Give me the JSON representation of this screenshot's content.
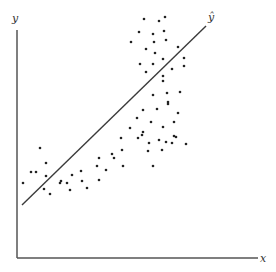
{
  "chart_data": {
    "type": "scatter",
    "title": "",
    "xlabel": "x",
    "ylabel": "y",
    "fit_label": "ŷ",
    "grid": false,
    "legend": null,
    "note": "Schematic scatter with linear regression line ŷ; no tick labels. Points listed in pixel coordinates (x right, y down).",
    "axes": {
      "origin": [
        17,
        258
      ],
      "x_end": [
        258,
        258
      ],
      "y_end": [
        17,
        30
      ]
    },
    "fit_line": {
      "start": [
        22,
        205
      ],
      "end": [
        206,
        26
      ]
    },
    "points": [
      [
        144,
        19
      ],
      [
        159,
        21
      ],
      [
        165,
        17
      ],
      [
        139,
        32
      ],
      [
        153,
        34
      ],
      [
        164,
        31
      ],
      [
        131,
        42
      ],
      [
        154,
        42
      ],
      [
        166,
        40
      ],
      [
        178,
        47
      ],
      [
        155,
        53
      ],
      [
        146,
        49
      ],
      [
        140,
        64
      ],
      [
        153,
        64
      ],
      [
        163,
        59
      ],
      [
        184,
        58
      ],
      [
        184,
        66
      ],
      [
        146,
        72
      ],
      [
        172,
        69
      ],
      [
        163,
        76
      ],
      [
        163,
        81
      ],
      [
        167,
        93
      ],
      [
        180,
        92
      ],
      [
        153,
        95
      ],
      [
        168,
        102
      ],
      [
        168,
        104
      ],
      [
        143,
        110
      ],
      [
        157,
        109
      ],
      [
        178,
        113
      ],
      [
        137,
        118
      ],
      [
        151,
        122
      ],
      [
        174,
        122
      ],
      [
        130,
        128
      ],
      [
        143,
        132
      ],
      [
        163,
        127
      ],
      [
        174,
        136
      ],
      [
        121,
        138
      ],
      [
        142,
        135
      ],
      [
        159,
        140
      ],
      [
        149,
        143
      ],
      [
        166,
        142
      ],
      [
        172,
        143
      ],
      [
        186,
        144
      ],
      [
        176,
        137
      ],
      [
        162,
        150
      ],
      [
        148,
        151
      ],
      [
        153,
        166
      ],
      [
        138,
        138
      ],
      [
        112,
        154
      ],
      [
        122,
        150
      ],
      [
        99,
        158
      ],
      [
        114,
        158
      ],
      [
        123,
        166
      ],
      [
        106,
        170
      ],
      [
        97,
        166
      ],
      [
        81,
        171
      ],
      [
        72,
        175
      ],
      [
        82,
        181
      ],
      [
        99,
        180
      ],
      [
        87,
        188
      ],
      [
        67,
        183
      ],
      [
        70,
        190
      ],
      [
        61,
        181
      ],
      [
        40,
        148
      ],
      [
        46,
        163
      ],
      [
        36,
        172
      ],
      [
        31,
        172
      ],
      [
        46,
        176
      ],
      [
        23,
        183
      ],
      [
        44,
        189
      ],
      [
        60,
        183
      ],
      [
        50,
        194
      ]
    ]
  },
  "colors": {
    "axis": "#555555",
    "line": "#3a3a3a",
    "point": "#222222"
  }
}
